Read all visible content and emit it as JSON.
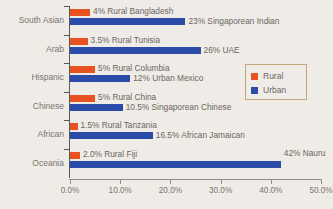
{
  "chart_data": {
    "type": "bar",
    "orientation": "horizontal",
    "title": "",
    "xlabel": "",
    "ylabel": "",
    "xlim": [
      0,
      50
    ],
    "xticks": [
      "0.0%",
      "10.0%",
      "20.0%",
      "30.0%",
      "40.0%",
      "50.0%"
    ],
    "xtick_values": [
      0,
      10,
      20,
      30,
      40,
      50
    ],
    "grid": false,
    "legend_position": "right-upper",
    "categories": [
      "South Asian",
      "Arab",
      "Hispanic",
      "Chinese",
      "African",
      "Oceania"
    ],
    "series": [
      {
        "name": "Rural",
        "color": "#e8521f",
        "values": [
          4,
          3.5,
          5,
          5,
          1.5,
          2.0
        ],
        "point_labels": [
          "4% Rural Bangladesh",
          "3.5% Rural Tunisia",
          "5% Rural Columbia",
          "5% Rural China",
          "1.5% Rural Tanzania",
          "2.0% Rural Fiji"
        ]
      },
      {
        "name": "Urban",
        "color": "#2b4ba8",
        "values": [
          23,
          26,
          12,
          10.5,
          16.5,
          42
        ],
        "point_labels": [
          "23% Singaporean Indian",
          "26% UAE",
          "12% Urban Mexico",
          "10.5% Singaporean Chinese",
          "16.5% African Jamaican",
          "42% Nauru"
        ]
      }
    ]
  },
  "legend": {
    "items": [
      {
        "label": "Rural",
        "color": "#e8521f"
      },
      {
        "label": "Urban",
        "color": "#2b4ba8"
      }
    ]
  },
  "caption": "",
  "colors": {
    "background": "#efebe6",
    "rural": "#e8521f",
    "urban": "#2b4ba8",
    "axis": "#5c5955",
    "text": "#6b6662",
    "legend_border": "#c4a87c"
  }
}
